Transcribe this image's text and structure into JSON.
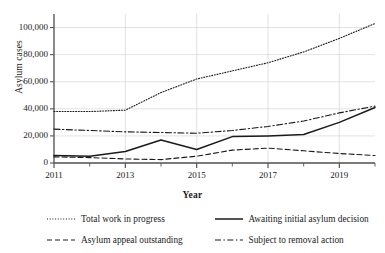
{
  "chart_data": {
    "type": "line",
    "title": "",
    "xlabel": "Year",
    "ylabel": "Asylum cases",
    "xlim": [
      2011,
      2020
    ],
    "ylim": [
      0,
      110000
    ],
    "ytick_values": [
      0,
      20000,
      40000,
      60000,
      80000,
      100000
    ],
    "ytick_labels": [
      "0",
      "20,000",
      "40,000",
      "60,000",
      "80,000",
      "100,000"
    ],
    "xtick_values": [
      2011,
      2012,
      2013,
      2014,
      2015,
      2016,
      2017,
      2018,
      2019,
      2020
    ],
    "xtick_labels": [
      "2011",
      "",
      "2013",
      "",
      "2015",
      "",
      "2017",
      "",
      "2019",
      ""
    ],
    "grid": true,
    "legend_position": "bottom",
    "x": [
      2011,
      2012,
      2013,
      2014,
      2015,
      2016,
      2017,
      2018,
      2019,
      2020
    ],
    "series": [
      {
        "name": "Total work in progress",
        "style": "dotted",
        "values": [
          38000,
          38000,
          39000,
          52000,
          62000,
          68000,
          74000,
          82000,
          92000,
          103000
        ]
      },
      {
        "name": "Awaiting initial asylum decision",
        "style": "solid",
        "values": [
          5500,
          5000,
          8500,
          17000,
          10000,
          19500,
          20000,
          21000,
          30000,
          41000
        ]
      },
      {
        "name": "Asylum appeal outstanding",
        "style": "dashed",
        "values": [
          4500,
          4000,
          3000,
          2500,
          5000,
          9500,
          11000,
          9000,
          7000,
          5500
        ]
      },
      {
        "name": "Subject to removal action",
        "style": "dashdot",
        "values": [
          25000,
          24000,
          23000,
          22500,
          22000,
          24000,
          27000,
          31000,
          37000,
          42000
        ]
      }
    ]
  },
  "legend": {
    "items": [
      {
        "label": "Total work in progress",
        "style": "dotted"
      },
      {
        "label": "Awaiting initial asylum decision",
        "style": "solid"
      },
      {
        "label": "Asylum appeal outstanding",
        "style": "dashed"
      },
      {
        "label": "Subject to removal action",
        "style": "dashdot"
      }
    ]
  },
  "colors": {
    "line": "#1a1a1a",
    "grid": "#d6d6d6",
    "axis": "#555555",
    "background": "#ffffff"
  }
}
